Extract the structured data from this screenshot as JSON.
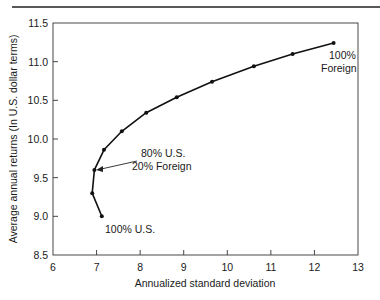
{
  "chart_data": {
    "type": "line",
    "title": "",
    "xlabel": "Annualized standard deviation",
    "ylabel": "Average annual returns (In U.S. dollar terms)",
    "xlim": [
      6,
      13
    ],
    "ylim": [
      8.5,
      11.5
    ],
    "x_ticks": [
      6,
      7,
      8,
      9,
      10,
      11,
      12,
      13
    ],
    "x_tick_labels": [
      "6",
      "7",
      "8",
      "9",
      "10",
      "11",
      "12",
      "13"
    ],
    "y_ticks": [
      8.5,
      9.0,
      9.5,
      10.0,
      10.5,
      11.0,
      11.5
    ],
    "y_tick_labels": [
      "8.5",
      "9.0",
      "9.5",
      "10.0",
      "10.5",
      "11.0",
      "11.5"
    ],
    "grid": false,
    "legend": null,
    "series": [
      {
        "name": "Efficient frontier (U.S./Foreign mix)",
        "x": [
          7.12,
          6.9,
          6.95,
          7.17,
          7.58,
          8.14,
          8.84,
          9.65,
          10.61,
          11.5,
          12.44
        ],
        "y": [
          9.0,
          9.3,
          9.6,
          9.86,
          10.1,
          10.34,
          10.54,
          10.74,
          10.94,
          11.1,
          11.24
        ],
        "markers": true
      }
    ],
    "annotations": [
      {
        "text_lines": [
          "100% U.S."
        ],
        "point_index": 0
      },
      {
        "text_lines": [
          "80% U.S.",
          "20% Foreign"
        ],
        "point_index": 2,
        "arrow": true
      },
      {
        "text_lines": [
          "100%",
          "Foreign"
        ],
        "point_index": 10
      }
    ]
  },
  "labels": {
    "xlabel": "Annualized standard deviation",
    "ylabel": "Average annual returns (In U.S. dollar terms)",
    "ann_us": "100% U.S.",
    "ann_mix_1": "80% U.S.",
    "ann_mix_2": "20% Foreign",
    "ann_foreign_1": "100%",
    "ann_foreign_2": "Foreign"
  }
}
